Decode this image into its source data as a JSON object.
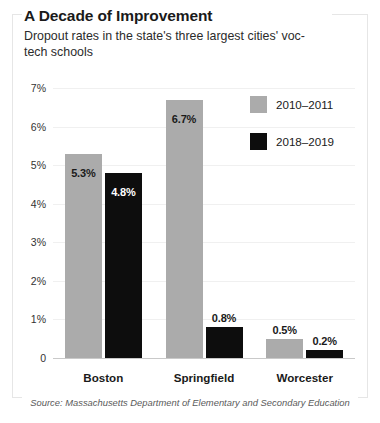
{
  "chart_data": {
    "type": "bar",
    "title": "A Decade of Improvement",
    "subtitle": "Dropout rates in the state's three largest cities' voc-tech schools",
    "source": "Source: Massachusetts Department of Elementary and Secondary Education",
    "categories": [
      "Boston",
      "Springfield",
      "Worcester"
    ],
    "series": [
      {
        "name": "2010–2011",
        "color": "#ababab",
        "values": [
          5.3,
          6.7,
          0.5
        ],
        "labels": [
          "5.3%",
          "6.7%",
          "0.5%"
        ]
      },
      {
        "name": "2018–2019",
        "color": "#0d0d0d",
        "values": [
          4.8,
          0.8,
          0.2
        ],
        "labels": [
          "4.8%",
          "0.8%",
          "0.2%"
        ]
      }
    ],
    "xlabel": "",
    "ylabel": "",
    "ylim": [
      0,
      7
    ],
    "yticks": [
      0,
      1,
      2,
      3,
      4,
      5,
      6,
      7
    ],
    "ytick_labels": [
      "0",
      "1%",
      "2%",
      "3%",
      "4%",
      "5%",
      "6%",
      "7%"
    ],
    "grid": true,
    "legend_position": "top-right"
  },
  "colors": {
    "series_2010": "#ababab",
    "series_2018": "#0d0d0d",
    "baseline": "#c9c9c9",
    "gridline": "#f0f0f0",
    "frame": "#e6e6e6",
    "text": "#1a1a1a",
    "source_text": "#5a5a5a"
  }
}
